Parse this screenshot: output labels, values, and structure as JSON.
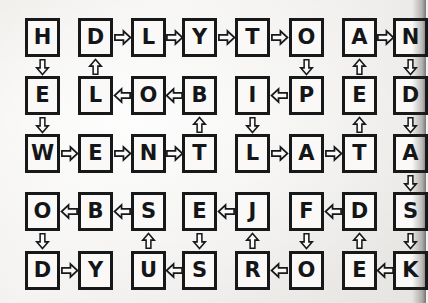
{
  "page": {
    "kind": "handwritten-letter-grid-puzzle",
    "background_color": "#f1f0ee",
    "ink_color": "#17181a",
    "box_fill": "#faf9f7",
    "columns": 8,
    "rows": 5
  },
  "grid": {
    "letters": [
      [
        "H",
        "D",
        "L",
        "Y",
        "T",
        "O",
        "A",
        "N"
      ],
      [
        "E",
        "L",
        "O",
        "B",
        "I",
        "P",
        "E",
        "D"
      ],
      [
        "W",
        "E",
        "N",
        "T",
        "L",
        "A",
        "T",
        "A"
      ],
      [
        "O",
        "B",
        "S",
        "E",
        "J",
        "F",
        "D",
        "S"
      ],
      [
        "D",
        "Y",
        "U",
        "S",
        "R",
        "O",
        "E",
        "K"
      ]
    ],
    "row_labels": [
      "row-1",
      "row-2",
      "row-3",
      "row-4",
      "row-5"
    ],
    "column_labels": [
      "col-1",
      "col-2",
      "col-3",
      "col-4",
      "col-5",
      "col-6",
      "col-7",
      "col-8"
    ]
  },
  "arrows": {
    "horizontal": [
      {
        "row": 0,
        "from_col": 1,
        "to_col": 2,
        "direction": "right"
      },
      {
        "row": 0,
        "from_col": 2,
        "to_col": 3,
        "direction": "right"
      },
      {
        "row": 0,
        "from_col": 3,
        "to_col": 4,
        "direction": "right"
      },
      {
        "row": 0,
        "from_col": 4,
        "to_col": 5,
        "direction": "right"
      },
      {
        "row": 0,
        "from_col": 6,
        "to_col": 7,
        "direction": "right"
      },
      {
        "row": 1,
        "from_col": 2,
        "to_col": 1,
        "direction": "left"
      },
      {
        "row": 1,
        "from_col": 3,
        "to_col": 2,
        "direction": "left"
      },
      {
        "row": 1,
        "from_col": 5,
        "to_col": 4,
        "direction": "left"
      },
      {
        "row": 2,
        "from_col": 0,
        "to_col": 1,
        "direction": "right"
      },
      {
        "row": 2,
        "from_col": 1,
        "to_col": 2,
        "direction": "right"
      },
      {
        "row": 2,
        "from_col": 2,
        "to_col": 3,
        "direction": "right"
      },
      {
        "row": 2,
        "from_col": 4,
        "to_col": 5,
        "direction": "right"
      },
      {
        "row": 2,
        "from_col": 5,
        "to_col": 6,
        "direction": "right"
      },
      {
        "row": 3,
        "from_col": 1,
        "to_col": 0,
        "direction": "left"
      },
      {
        "row": 3,
        "from_col": 2,
        "to_col": 1,
        "direction": "left"
      },
      {
        "row": 3,
        "from_col": 4,
        "to_col": 3,
        "direction": "left"
      },
      {
        "row": 3,
        "from_col": 6,
        "to_col": 5,
        "direction": "left"
      },
      {
        "row": 4,
        "from_col": 0,
        "to_col": 1,
        "direction": "right"
      },
      {
        "row": 4,
        "from_col": 3,
        "to_col": 2,
        "direction": "left"
      },
      {
        "row": 4,
        "from_col": 5,
        "to_col": 4,
        "direction": "left"
      },
      {
        "row": 4,
        "from_col": 7,
        "to_col": 6,
        "direction": "left"
      }
    ],
    "vertical": [
      {
        "col": 0,
        "from_row": 0,
        "to_row": 1,
        "direction": "down"
      },
      {
        "col": 1,
        "from_row": 1,
        "to_row": 0,
        "direction": "up"
      },
      {
        "col": 5,
        "from_row": 0,
        "to_row": 1,
        "direction": "down"
      },
      {
        "col": 6,
        "from_row": 1,
        "to_row": 0,
        "direction": "up"
      },
      {
        "col": 7,
        "from_row": 0,
        "to_row": 1,
        "direction": "down"
      },
      {
        "col": 0,
        "from_row": 1,
        "to_row": 2,
        "direction": "down"
      },
      {
        "col": 3,
        "from_row": 2,
        "to_row": 1,
        "direction": "up"
      },
      {
        "col": 4,
        "from_row": 1,
        "to_row": 2,
        "direction": "down"
      },
      {
        "col": 6,
        "from_row": 2,
        "to_row": 1,
        "direction": "up"
      },
      {
        "col": 7,
        "from_row": 1,
        "to_row": 2,
        "direction": "down"
      },
      {
        "col": 7,
        "from_row": 2,
        "to_row": 3,
        "direction": "down"
      },
      {
        "col": 0,
        "from_row": 3,
        "to_row": 4,
        "direction": "down"
      },
      {
        "col": 2,
        "from_row": 4,
        "to_row": 3,
        "direction": "up"
      },
      {
        "col": 3,
        "from_row": 3,
        "to_row": 4,
        "direction": "down"
      },
      {
        "col": 4,
        "from_row": 4,
        "to_row": 3,
        "direction": "up"
      },
      {
        "col": 5,
        "from_row": 3,
        "to_row": 4,
        "direction": "down"
      },
      {
        "col": 6,
        "from_row": 4,
        "to_row": 3,
        "direction": "up"
      },
      {
        "col": 7,
        "from_row": 3,
        "to_row": 4,
        "direction": "down"
      }
    ]
  },
  "layout": {
    "col_x": [
      25,
      78,
      131,
      182,
      235,
      289,
      342,
      393
    ],
    "row_y": [
      18,
      76,
      134,
      192,
      251
    ],
    "cell_w": 35,
    "cell_h": 39
  }
}
